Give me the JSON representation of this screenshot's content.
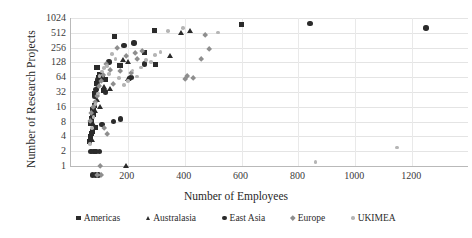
{
  "chart_data": {
    "type": "scatter",
    "title": "",
    "xlabel": "Number of Employees",
    "ylabel": "Number of Research Projects",
    "xlim": [
      0,
      1400
    ],
    "ylim": [
      1,
      1024
    ],
    "yscale": "log2",
    "grid": true,
    "legend_position": "bottom",
    "xticks": [
      200,
      400,
      600,
      800,
      1000,
      1200
    ],
    "yticks": [
      1,
      2,
      4,
      8,
      16,
      32,
      64,
      128,
      256,
      512,
      1024
    ],
    "series": [
      {
        "name": "Americas",
        "marker": "square",
        "color": "#2b2b2b",
        "points": [
          [
            95,
            100
          ],
          [
            103,
            72
          ],
          [
            100,
            64
          ],
          [
            106,
            60
          ],
          [
            93,
            48
          ],
          [
            88,
            30
          ],
          [
            92,
            28
          ],
          [
            85,
            17
          ],
          [
            81,
            14
          ],
          [
            78,
            12
          ],
          [
            84,
            11
          ],
          [
            76,
            9
          ],
          [
            74,
            7.5
          ],
          [
            89,
            6
          ],
          [
            80,
            5
          ],
          [
            75,
            4.5
          ],
          [
            71,
            4
          ],
          [
            69,
            3.2
          ],
          [
            156,
            430
          ],
          [
            296,
            580
          ],
          [
            604,
            760
          ],
          [
            176,
            112
          ],
          [
            262,
            205
          ],
          [
            300,
            118
          ],
          [
            118,
            34
          ],
          [
            114,
            62
          ],
          [
            126,
            58
          ]
        ]
      },
      {
        "name": "Australasia",
        "marker": "triangle",
        "color": "#2b2b2b",
        "points": [
          [
            186,
            140
          ],
          [
            206,
            132
          ],
          [
            392,
            510
          ],
          [
            424,
            560
          ],
          [
            354,
            172
          ],
          [
            205,
            58
          ],
          [
            96,
            22
          ],
          [
            87,
            13
          ],
          [
            83,
            7
          ],
          [
            77,
            3.4
          ],
          [
            196,
            1
          ],
          [
            140,
            36
          ],
          [
            120,
            40
          ],
          [
            105,
            16
          ]
        ]
      },
      {
        "name": "East Asia",
        "marker": "circle",
        "color": "#2b2b2b",
        "points": [
          [
            844,
            800
          ],
          [
            190,
            280
          ],
          [
            225,
            320
          ],
          [
            262,
            118
          ],
          [
            215,
            64
          ],
          [
            210,
            60
          ],
          [
            178,
            9
          ],
          [
            152,
            8
          ],
          [
            137,
            130
          ],
          [
            125,
            32
          ],
          [
            113,
            7
          ],
          [
            99,
            56
          ],
          [
            96,
            46
          ],
          [
            92,
            36
          ],
          [
            88,
            26
          ],
          [
            104,
            2
          ],
          [
            92,
            2
          ],
          [
            84,
            2
          ],
          [
            74,
            2
          ],
          [
            1252,
            640
          ],
          [
            80,
            0.66
          ],
          [
            90,
            0.66
          ],
          [
            100,
            0.66
          ]
        ]
      },
      {
        "name": "Europe",
        "marker": "diamond",
        "color": "#8e8e8e",
        "points": [
          [
            476,
            460
          ],
          [
            490,
            240
          ],
          [
            462,
            152
          ],
          [
            432,
            62
          ],
          [
            412,
            66
          ],
          [
            406,
            58
          ],
          [
            254,
            215
          ],
          [
            238,
            150
          ],
          [
            228,
            196
          ],
          [
            215,
            78
          ],
          [
            196,
            170
          ],
          [
            178,
            86
          ],
          [
            166,
            250
          ],
          [
            152,
            46
          ],
          [
            140,
            90
          ],
          [
            128,
            120
          ],
          [
            118,
            70
          ],
          [
            110,
            52
          ],
          [
            102,
            42
          ],
          [
            95,
            26
          ],
          [
            88,
            20
          ],
          [
            82,
            16
          ],
          [
            76,
            12
          ],
          [
            72,
            8
          ],
          [
            120,
            6
          ],
          [
            132,
            4.4
          ],
          [
            106,
            1
          ],
          [
            96,
            0.66
          ],
          [
            110,
            0.66
          ]
        ]
      },
      {
        "name": "UKIMEA",
        "marker": "dot",
        "color": "#b5b5b5",
        "points": [
          [
            520,
            520
          ],
          [
            398,
            640
          ],
          [
            344,
            560
          ],
          [
            318,
            210
          ],
          [
            300,
            180
          ],
          [
            284,
            132
          ],
          [
            268,
            142
          ],
          [
            250,
            100
          ],
          [
            236,
            66
          ],
          [
            220,
            88
          ],
          [
            204,
            54
          ],
          [
            190,
            44
          ],
          [
            172,
            62
          ],
          [
            160,
            150
          ],
          [
            148,
            188
          ],
          [
            138,
            74
          ],
          [
            130,
            108
          ],
          [
            120,
            98
          ],
          [
            112,
            84
          ],
          [
            104,
            68
          ],
          [
            98,
            30
          ],
          [
            90,
            18
          ],
          [
            83,
            10
          ],
          [
            78,
            6
          ],
          [
            70,
            2.8
          ],
          [
            1150,
            2.4
          ],
          [
            864,
            1.2
          ]
        ]
      }
    ]
  },
  "legend": {
    "items": [
      {
        "label": "Americas",
        "marker": "square-marker"
      },
      {
        "label": "Australasia",
        "marker": "triangle-marker"
      },
      {
        "label": "East Asia",
        "marker": "circle-marker"
      },
      {
        "label": "Europe",
        "marker": "diamond-marker"
      },
      {
        "label": "UKIMEA",
        "marker": "dot-marker"
      }
    ]
  }
}
